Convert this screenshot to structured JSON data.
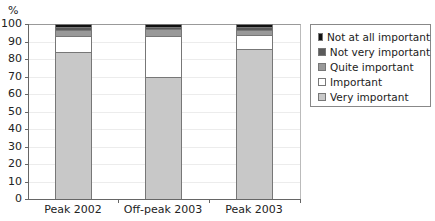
{
  "chart_data": {
    "type": "bar",
    "stacked": true,
    "title": "",
    "xlabel": "",
    "ylabel": "%",
    "ylim": [
      0,
      100
    ],
    "yticks": [
      0,
      10,
      20,
      30,
      40,
      50,
      60,
      70,
      80,
      90,
      100
    ],
    "grid": true,
    "legend_position": "right",
    "categories": [
      "Peak 2002",
      "Off-peak 2003",
      "Peak 2003"
    ],
    "series": [
      {
        "name": "Very important",
        "color": "#c8c8c8",
        "values": [
          84,
          70,
          85.5
        ]
      },
      {
        "name": "Important",
        "color": "#ffffff",
        "values": [
          9,
          23,
          8.5
        ]
      },
      {
        "name": "Quite important",
        "color": "#999999",
        "values": [
          3.5,
          4,
          2.5
        ]
      },
      {
        "name": "Not very important",
        "color": "#5a5a5a",
        "values": [
          2,
          1.5,
          2
        ]
      },
      {
        "name": "Not at all important",
        "color": "#111111",
        "values": [
          1.5,
          1.5,
          1.5
        ]
      }
    ]
  },
  "legend": [
    {
      "label": "Not at all important",
      "color": "#111111"
    },
    {
      "label": "Not very important",
      "color": "#5a5a5a"
    },
    {
      "label": "Quite important",
      "color": "#999999"
    },
    {
      "label": "Important",
      "color": "#ffffff"
    },
    {
      "label": "Very important",
      "color": "#c8c8c8"
    }
  ]
}
